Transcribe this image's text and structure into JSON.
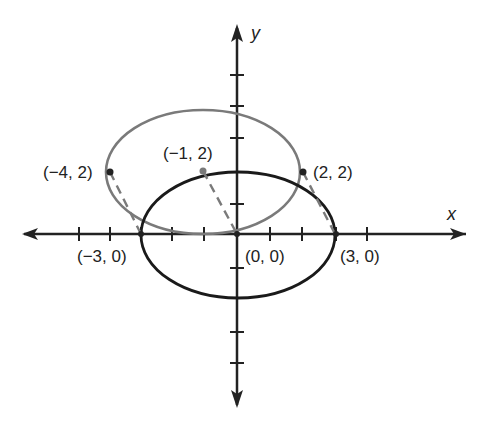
{
  "diagram": {
    "type": "coordinate-plane-ellipse-translation",
    "axes": {
      "x_label": "x",
      "y_label": "y",
      "x_range": [
        -6,
        6
      ],
      "y_range": [
        -5,
        6
      ],
      "tick_spacing": 1
    },
    "ellipses": [
      {
        "name": "original",
        "center": [
          0,
          0
        ],
        "a": 3,
        "b": 2,
        "color": "#1a1a1a"
      },
      {
        "name": "translated",
        "center": [
          -1,
          2
        ],
        "a": 3,
        "b": 2,
        "color": "#7a7a7a"
      }
    ],
    "points": [
      {
        "label": "(−4, 2)",
        "x": -4,
        "y": 2
      },
      {
        "label": "(−1, 2)",
        "x": -1,
        "y": 2
      },
      {
        "label": "(2, 2)",
        "x": 2,
        "y": 2
      },
      {
        "label": "(−3, 0)",
        "x": -3,
        "y": 0
      },
      {
        "label": "(0, 0)",
        "x": 0,
        "y": 0
      },
      {
        "label": "(3, 0)",
        "x": 3,
        "y": 0
      }
    ],
    "dashed_segments": [
      {
        "from": [
          -4,
          2
        ],
        "to": [
          -3,
          0
        ]
      },
      {
        "from": [
          -1,
          2
        ],
        "to": [
          0,
          0
        ]
      },
      {
        "from": [
          2,
          2
        ],
        "to": [
          3,
          0
        ]
      }
    ]
  }
}
